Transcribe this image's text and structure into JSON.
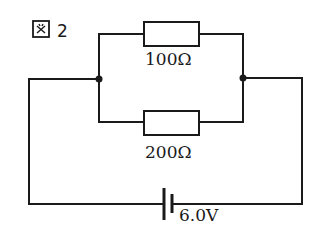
{
  "figure": {
    "label": "図 2"
  },
  "circuit": {
    "components": [
      {
        "type": "resistor",
        "branch": "upper",
        "value": "100Ω"
      },
      {
        "type": "resistor",
        "branch": "lower",
        "value": "200Ω"
      },
      {
        "type": "battery",
        "value": "6.0V"
      }
    ],
    "connection": "parallel resistors in series with battery",
    "junctions": 2
  },
  "colors": {
    "line": "#1a1a1a",
    "background": "#ffffff"
  }
}
